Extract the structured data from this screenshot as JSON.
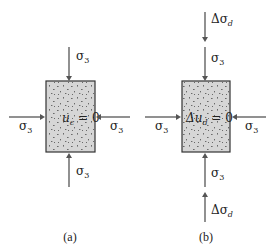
{
  "figure": {
    "panels": [
      {
        "id": "a",
        "caption": "(a)",
        "box_label_main": "u",
        "box_label_sub": "c",
        "box_label_rest": " = 0",
        "top_arrows": [
          {
            "symbol": "σ",
            "sub": "3"
          }
        ],
        "bottom_arrows": [
          {
            "symbol": "σ",
            "sub": "3"
          }
        ],
        "left_arrow": {
          "symbol": "σ",
          "sub": "3"
        },
        "right_arrow": {
          "symbol": "σ",
          "sub": "3"
        }
      },
      {
        "id": "b",
        "caption": "(b)",
        "box_label_main": "Δu",
        "box_label_sub": "d",
        "box_label_rest": " = 0",
        "top_arrows": [
          {
            "symbol": "Δσ",
            "sub": "d"
          },
          {
            "symbol": "σ",
            "sub": "3"
          }
        ],
        "bottom_arrows": [
          {
            "symbol": "σ",
            "sub": "3"
          },
          {
            "symbol": "Δσ",
            "sub": "d"
          }
        ],
        "left_arrow": {
          "symbol": "σ",
          "sub": "3"
        },
        "right_arrow": {
          "symbol": "σ",
          "sub": "3"
        }
      }
    ],
    "colors": {
      "sample_fill": "#d6d6d6",
      "arrow": "#555555",
      "outline": "#333333"
    }
  }
}
